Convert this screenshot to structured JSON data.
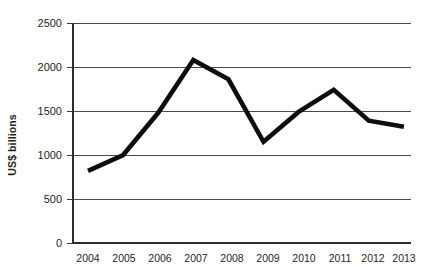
{
  "chart_data": {
    "type": "line",
    "title": "",
    "subtitle": "",
    "xlabel": "",
    "ylabel": "US$ billions",
    "categories": [
      "2004",
      "2005",
      "2006",
      "2007",
      "2008",
      "2009",
      "2010",
      "2011",
      "2012",
      "2013"
    ],
    "values": [
      820,
      1000,
      1480,
      2080,
      1860,
      1150,
      1490,
      1740,
      1390,
      1320
    ],
    "series": [
      {
        "name": "US$ billions",
        "values": [
          820,
          1000,
          1480,
          2080,
          1860,
          1150,
          1490,
          1740,
          1390,
          1320
        ],
        "color": "#0d0d0d"
      }
    ],
    "ylim": [
      0,
      2500
    ],
    "yticks": [
      0,
      500,
      1000,
      1500,
      2000,
      2500
    ],
    "ytick_labels": [
      "0",
      "500",
      "1000",
      "1500",
      "2000",
      "2500"
    ],
    "xtick_labels": [
      "2004",
      "2005",
      "2006",
      "2007",
      "2008",
      "2009",
      "2010",
      "2011",
      "2012",
      "2013"
    ],
    "grid": true,
    "grid_axis": "y",
    "legend": false,
    "legend_position": "none",
    "line_color": "#0d0d0d",
    "line_width": 4.6,
    "markers": false,
    "background_color": "#ffffff"
  },
  "axes": {
    "y_title": "US$ billions",
    "y_tick_0": "0",
    "y_tick_1": "500",
    "y_tick_2": "1000",
    "y_tick_3": "1500",
    "y_tick_4": "2000",
    "y_tick_5": "2500",
    "x_tick_0": "2004",
    "x_tick_1": "2005",
    "x_tick_2": "2006",
    "x_tick_3": "2007",
    "x_tick_4": "2008",
    "x_tick_5": "2009",
    "x_tick_6": "2010",
    "x_tick_7": "2011",
    "x_tick_8": "2012",
    "x_tick_9": "2013"
  }
}
